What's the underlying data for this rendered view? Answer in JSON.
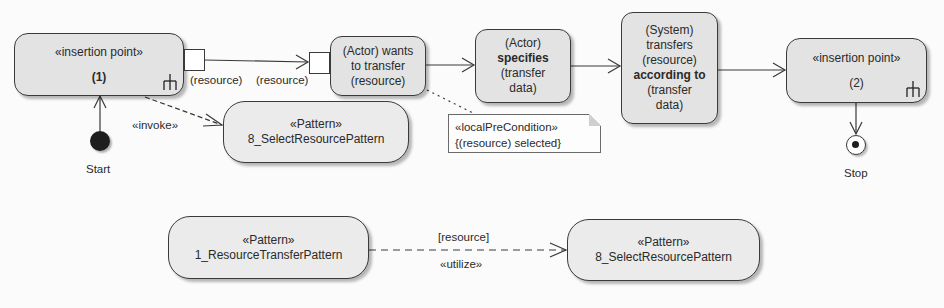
{
  "diagram": {
    "type": "UML activity diagram",
    "nodes": {
      "insertion_point_1": {
        "stereotype": "«insertion point»",
        "label": "(1)"
      },
      "actor_wants": {
        "lines": [
          "(Actor) wants",
          "to transfer",
          "(resource)"
        ]
      },
      "actor_specifies": {
        "lines": [
          "(Actor)",
          "specifies",
          "(transfer",
          "data)"
        ]
      },
      "system_transfers": {
        "lines": [
          "(System)",
          "transfers",
          "(resource)",
          "according to",
          "(transfer",
          "data)"
        ]
      },
      "insertion_point_2": {
        "stereotype": "«insertion point»",
        "label": "(2)"
      },
      "pattern_select_top": {
        "stereotype": "«Pattern»",
        "name": "8_SelectResourcePattern"
      },
      "pattern_transfer_bottom": {
        "stereotype": "«Pattern»",
        "name": "1_ResourceTransferPattern"
      },
      "pattern_select_bottom": {
        "stereotype": "«Pattern»",
        "name": "8_SelectResourcePattern"
      },
      "start": {
        "label": "Start"
      },
      "stop": {
        "label": "Stop"
      }
    },
    "pins": {
      "output_pin_label": "(resource)",
      "input_pin_label": "(resource)"
    },
    "note": {
      "stereotype": "«localPreCondition»",
      "text": "{(resource) selected}"
    },
    "edges": {
      "invoke_label": "«invoke»",
      "utilize_guard": "[resource]",
      "utilize_label": "«utilize»"
    },
    "colors": {
      "node_fill": "#e3e3e3",
      "border": "#3a3a3a",
      "background": "#fbfbfb"
    }
  }
}
